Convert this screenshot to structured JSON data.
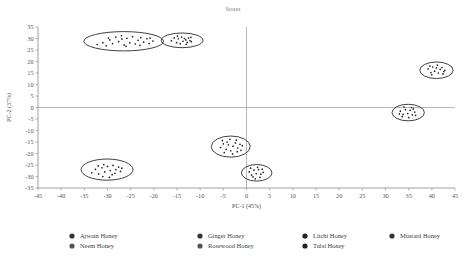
{
  "chart_data": {
    "type": "scatter",
    "title": "Scores",
    "xlabel": "PC-1 (45%)",
    "ylabel": "PC-2 (37%)",
    "xlim": [
      -45,
      45
    ],
    "ylim": [
      -35,
      35
    ],
    "xticks": [
      -45,
      -40,
      -35,
      -30,
      -25,
      -20,
      -15,
      -10,
      -5,
      0,
      5,
      10,
      15,
      20,
      25,
      30,
      35,
      40,
      45
    ],
    "yticks": [
      -35,
      -30,
      -25,
      -20,
      -15,
      -10,
      -5,
      0,
      5,
      10,
      15,
      20,
      25,
      30,
      35
    ],
    "grid": false,
    "legend_position": "bottom",
    "marker_color": "#222222",
    "ellipse_color": "#2b2b2b",
    "axis_color": "#8a8a8a",
    "series": [
      {
        "name": "Ajwain Honey",
        "ellipse": {
          "cx": -26.5,
          "cy": 28.8,
          "rx": 8.6,
          "ry": 4.2,
          "rot": 0
        },
        "points": [
          [
            -32.2,
            27.4
          ],
          [
            -31.0,
            28.2
          ],
          [
            -30.3,
            26.9
          ],
          [
            -29.5,
            29.4
          ],
          [
            -28.9,
            27.8
          ],
          [
            -28.2,
            30.6
          ],
          [
            -27.6,
            28.6
          ],
          [
            -27.0,
            31.2
          ],
          [
            -26.4,
            27.2
          ],
          [
            -26.9,
            29.8
          ],
          [
            -25.8,
            30.1
          ],
          [
            -25.2,
            28.1
          ],
          [
            -24.6,
            30.8
          ],
          [
            -24.0,
            27.6
          ],
          [
            -23.4,
            29.2
          ],
          [
            -22.8,
            30.4
          ],
          [
            -22.2,
            28.4
          ],
          [
            -21.5,
            29.9
          ],
          [
            -20.8,
            30.2
          ],
          [
            -20.2,
            28.9
          ],
          [
            -29.8,
            30.2
          ],
          [
            -26.0,
            26.6
          ],
          [
            -23.0,
            27.0
          ],
          [
            -21.0,
            27.8
          ]
        ]
      },
      {
        "name": "Ginger Honey",
        "ellipse": {
          "cx": -13.9,
          "cy": 29.2,
          "rx": 4.5,
          "ry": 3.2,
          "rot": 0
        },
        "points": [
          [
            -16.2,
            29.0
          ],
          [
            -15.6,
            30.3
          ],
          [
            -15.1,
            28.2
          ],
          [
            -14.7,
            29.9
          ],
          [
            -14.3,
            27.7
          ],
          [
            -14.0,
            30.6
          ],
          [
            -13.7,
            28.8
          ],
          [
            -13.4,
            30.0
          ],
          [
            -13.1,
            29.4
          ],
          [
            -12.8,
            28.3
          ],
          [
            -12.5,
            30.2
          ],
          [
            -12.2,
            29.1
          ],
          [
            -11.9,
            28.6
          ],
          [
            -13.0,
            27.5
          ],
          [
            -14.9,
            31.0
          ],
          [
            -12.0,
            30.5
          ]
        ]
      },
      {
        "name": "Litchi Honey",
        "ellipse": {
          "cx": -30.1,
          "cy": -27.0,
          "rx": 5.6,
          "ry": 4.6,
          "rot": 0
        },
        "points": [
          [
            -33.4,
            -28.4
          ],
          [
            -32.6,
            -26.9
          ],
          [
            -31.9,
            -28.9
          ],
          [
            -31.2,
            -26.2
          ],
          [
            -30.6,
            -28.0
          ],
          [
            -30.0,
            -25.6
          ],
          [
            -29.4,
            -27.4
          ],
          [
            -28.8,
            -25.2
          ],
          [
            -28.2,
            -27.0
          ],
          [
            -27.6,
            -25.9
          ],
          [
            -29.0,
            -29.2
          ],
          [
            -30.8,
            -24.8
          ],
          [
            -28.4,
            -28.6
          ],
          [
            -27.2,
            -27.8
          ],
          [
            -32.0,
            -25.4
          ],
          [
            -31.0,
            -30.0
          ],
          [
            -29.6,
            -30.4
          ],
          [
            -26.9,
            -26.4
          ]
        ]
      },
      {
        "name": "Mustard Honey",
        "ellipse": {
          "cx": 41.0,
          "cy": 16.2,
          "rx": 3.6,
          "ry": 3.6,
          "rot": 0
        },
        "points": [
          [
            39.2,
            16.8
          ],
          [
            39.8,
            15.2
          ],
          [
            40.2,
            17.6
          ],
          [
            40.6,
            15.8
          ],
          [
            41.0,
            17.2
          ],
          [
            41.4,
            15.0
          ],
          [
            41.8,
            16.6
          ],
          [
            42.2,
            17.4
          ],
          [
            42.6,
            15.6
          ],
          [
            40.0,
            14.2
          ],
          [
            41.2,
            18.4
          ],
          [
            42.4,
            14.6
          ],
          [
            39.6,
            18.0
          ],
          [
            42.8,
            16.2
          ]
        ]
      },
      {
        "name": "Neem Honey",
        "ellipse": {
          "cx": -3.4,
          "cy": -17.0,
          "rx": 4.2,
          "ry": 4.6,
          "rot": 0
        },
        "points": [
          [
            -5.6,
            -17.4
          ],
          [
            -5.0,
            -15.8
          ],
          [
            -4.4,
            -18.2
          ],
          [
            -3.9,
            -16.2
          ],
          [
            -3.4,
            -18.8
          ],
          [
            -2.9,
            -16.8
          ],
          [
            -2.4,
            -15.4
          ],
          [
            -1.9,
            -17.6
          ],
          [
            -1.4,
            -16.0
          ],
          [
            -4.8,
            -19.6
          ],
          [
            -3.0,
            -20.2
          ],
          [
            -2.0,
            -19.2
          ],
          [
            -5.2,
            -14.4
          ],
          [
            -3.6,
            -13.8
          ],
          [
            -2.2,
            -14.2
          ],
          [
            -1.2,
            -18.6
          ],
          [
            -4.2,
            -15.0
          ],
          [
            -0.9,
            -16.6
          ]
        ]
      },
      {
        "name": "Rosewood Honey",
        "ellipse": {
          "cx": 2.2,
          "cy": -28.4,
          "rx": 3.3,
          "ry": 3.6,
          "rot": 0
        },
        "points": [
          [
            0.6,
            -28.0
          ],
          [
            1.1,
            -29.4
          ],
          [
            1.6,
            -27.2
          ],
          [
            2.1,
            -28.8
          ],
          [
            2.6,
            -27.0
          ],
          [
            3.1,
            -29.0
          ],
          [
            3.6,
            -28.2
          ],
          [
            1.4,
            -30.2
          ],
          [
            2.9,
            -30.4
          ],
          [
            0.9,
            -26.4
          ],
          [
            2.4,
            -26.0
          ],
          [
            3.4,
            -26.8
          ],
          [
            1.9,
            -31.0
          ]
        ]
      },
      {
        "name": "Tulsi Honey",
        "ellipse": {
          "cx": 34.9,
          "cy": -2.2,
          "rx": 3.5,
          "ry": 3.6,
          "rot": 0
        },
        "points": [
          [
            33.2,
            -1.6
          ],
          [
            33.8,
            -3.0
          ],
          [
            34.3,
            -0.9
          ],
          [
            34.8,
            -2.6
          ],
          [
            35.3,
            -1.2
          ],
          [
            35.8,
            -3.2
          ],
          [
            36.3,
            -2.0
          ],
          [
            33.6,
            -4.0
          ],
          [
            35.0,
            -4.4
          ],
          [
            36.0,
            -0.6
          ],
          [
            34.0,
            0.2
          ],
          [
            35.6,
            0.0
          ],
          [
            36.5,
            -3.4
          ],
          [
            33.0,
            -2.8
          ]
        ]
      }
    ],
    "legend": [
      {
        "label": "Ajwain Honey",
        "color": "#333333",
        "col": 0,
        "row": 0
      },
      {
        "label": "Neem Honey",
        "color": "#555555",
        "col": 0,
        "row": 1
      },
      {
        "label": "Ginger Honey",
        "color": "#333333",
        "col": 1,
        "row": 0
      },
      {
        "label": "Rosewood Honey",
        "color": "#555555",
        "col": 1,
        "row": 1
      },
      {
        "label": "Litchi Honey",
        "color": "#222222",
        "col": 2,
        "row": 0
      },
      {
        "label": "Tulsi Honey",
        "color": "#222222",
        "col": 2,
        "row": 1
      },
      {
        "label": "Mustard Honey",
        "color": "#333333",
        "col": 3,
        "row": 0
      }
    ]
  }
}
